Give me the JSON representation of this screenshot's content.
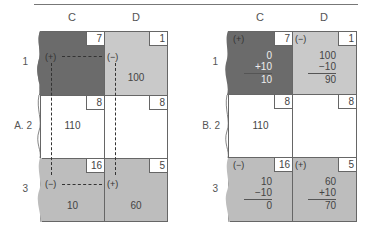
{
  "columns": [
    "C",
    "D"
  ],
  "panels": [
    {
      "label_prefix": "A.",
      "rows": [
        "1",
        "2",
        "3"
      ],
      "cells": {
        "r1c": {
          "corner": "7",
          "sign": "(+)",
          "value": ""
        },
        "r1d": {
          "corner": "1",
          "sign": "(−)",
          "value": "100"
        },
        "r2c": {
          "corner": "8",
          "value": "110"
        },
        "r2d": {
          "corner": "8",
          "value": ""
        },
        "r3c": {
          "corner": "16",
          "sign": "(−)",
          "value": "10"
        },
        "r3d": {
          "corner": "5",
          "sign": "(+)",
          "value": "60"
        }
      }
    },
    {
      "label_prefix": "B.",
      "rows": [
        "1",
        "2",
        "3"
      ],
      "cells": {
        "r1c": {
          "corner": "7",
          "sign": "(+)",
          "calc": [
            "0",
            "+10",
            "10"
          ]
        },
        "r1d": {
          "corner": "1",
          "sign": "(−)",
          "calc": [
            "100",
            "−10",
            "90"
          ]
        },
        "r2c": {
          "corner": "8",
          "value": "110"
        },
        "r2d": {
          "corner": "8",
          "value": ""
        },
        "r3c": {
          "corner": "16",
          "sign": "(−)",
          "calc": [
            "10",
            "−10",
            "0"
          ]
        },
        "r3d": {
          "corner": "5",
          "sign": "(+)",
          "calc": [
            "60",
            "+10",
            "70"
          ]
        }
      }
    }
  ],
  "colors": {
    "dark": "#6b6b6b",
    "light": "#c9c9c9",
    "mid": "#bdbdbd"
  }
}
